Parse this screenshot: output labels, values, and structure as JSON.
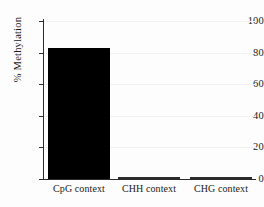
{
  "chart_data": {
    "type": "bar",
    "title": "",
    "subtitle": "",
    "xlabel": "",
    "ylabel": "% Methylation",
    "categories": [
      "CpG context",
      "CHH context",
      "CHG context"
    ],
    "values": [
      83,
      1,
      1
    ],
    "ylim": [
      0,
      100
    ],
    "yticks": [
      0,
      20,
      40,
      60,
      80,
      100
    ],
    "ytick_labels": [
      "0",
      "20",
      "40",
      "60",
      "80",
      "100"
    ],
    "grid": true,
    "grid_axis": "y",
    "legend": null,
    "legend_position": "none",
    "annotations": [],
    "bar_styles": [
      "filled",
      "hollow",
      "hollow"
    ],
    "colors": {
      "bar_fill": "#000000",
      "bar_outline": "#2b2b2b",
      "hollow_fill": "#ffffff",
      "axis": "#2b2b2b",
      "grid": "#f1f1f1",
      "background": "#fdfdfd",
      "text": "#1a1a1a"
    }
  }
}
